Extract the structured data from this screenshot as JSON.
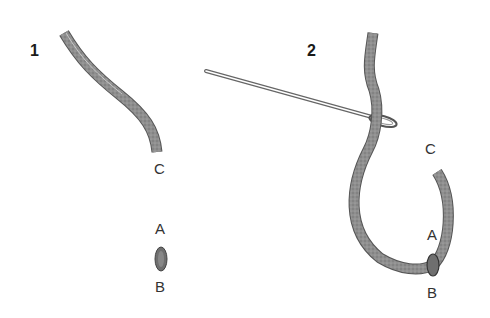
{
  "diagram": {
    "steps": [
      {
        "number": "1",
        "labels": {
          "c": "C",
          "a": "A",
          "b": "B"
        }
      },
      {
        "number": "2",
        "labels": {
          "c": "C",
          "a": "A",
          "b": "B"
        }
      }
    ],
    "colors": {
      "thread": "#8a8a8a",
      "thread_edge": "#555555",
      "needle": "#6a6a6a",
      "text": "#222222"
    }
  }
}
